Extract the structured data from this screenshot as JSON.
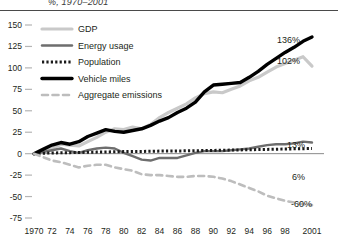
{
  "chart_data": {
    "type": "line",
    "title": "%, 1970–2001",
    "xlabel": "",
    "ylabel": "",
    "ylim": [
      -75,
      150
    ],
    "yticks": [
      150,
      125,
      100,
      75,
      50,
      25,
      0,
      -25,
      -50,
      -75
    ],
    "ytick_labels": [
      "150",
      "125",
      "100",
      "75",
      "50",
      "25",
      "0",
      "-25",
      "-50",
      "-75"
    ],
    "xlim": [
      1970,
      2001
    ],
    "xticks": [
      1970,
      1972,
      1974,
      1976,
      1978,
      1980,
      1982,
      1984,
      1986,
      1988,
      1990,
      1992,
      1994,
      1996,
      1998,
      2001
    ],
    "xtick_labels": [
      "1970",
      "72",
      "74",
      "76",
      "78",
      "80",
      "82",
      "84",
      "86",
      "88",
      "90",
      "92",
      "94",
      "96",
      "98",
      "2001"
    ],
    "grid": false,
    "legend_position": "upper-left",
    "x": [
      1970,
      1971,
      1972,
      1973,
      1974,
      1975,
      1976,
      1977,
      1978,
      1979,
      1980,
      1981,
      1982,
      1983,
      1984,
      1985,
      1986,
      1987,
      1988,
      1989,
      1990,
      1991,
      1992,
      1993,
      1994,
      1995,
      1996,
      1997,
      1998,
      1999,
      2000,
      2001
    ],
    "series": [
      {
        "name": "GDP",
        "color": "#c9c9c9",
        "style": "solid",
        "width": 3.2,
        "end_label": "102%",
        "values": [
          0,
          2,
          6,
          11,
          10,
          9,
          14,
          19,
          25,
          29,
          28,
          31,
          29,
          34,
          42,
          48,
          53,
          58,
          65,
          70,
          72,
          71,
          75,
          79,
          85,
          89,
          95,
          101,
          105,
          109,
          113,
          102
        ]
      },
      {
        "name": "Energy usage",
        "color": "#6e6e6e",
        "style": "solid",
        "width": 2.4,
        "end_label": "13%",
        "values": [
          0,
          2,
          4,
          6,
          3,
          1,
          4,
          6,
          7,
          6,
          1,
          -3,
          -7,
          -8,
          -5,
          -5,
          -5,
          -2,
          1,
          3,
          3,
          3,
          4,
          5,
          6,
          8,
          10,
          11,
          11,
          12,
          14,
          13
        ]
      },
      {
        "name": "Population",
        "color": "#1a1a1a",
        "style": "dotted",
        "width": 3.0,
        "end_label": "6%",
        "values": [
          0,
          0.5,
          0.8,
          1.0,
          1.2,
          1.4,
          1.6,
          1.8,
          2.0,
          2.2,
          2.4,
          2.5,
          2.6,
          2.8,
          3.0,
          3.1,
          3.2,
          3.3,
          3.5,
          3.6,
          3.8,
          4.0,
          4.2,
          4.4,
          4.6,
          4.8,
          5.0,
          5.2,
          5.4,
          5.6,
          5.8,
          6
        ]
      },
      {
        "name": "Vehicle miles",
        "color": "#000000",
        "style": "solid",
        "width": 3.4,
        "end_label": "136%",
        "values": [
          0,
          5,
          10,
          13,
          11,
          14,
          20,
          24,
          28,
          26,
          25,
          27,
          29,
          33,
          38,
          42,
          48,
          53,
          60,
          72,
          80,
          81,
          82,
          83,
          89,
          96,
          104,
          111,
          118,
          124,
          131,
          136
        ]
      },
      {
        "name": "Aggregate emissions",
        "color": "#bdbdbd",
        "style": "dashed",
        "width": 2.6,
        "end_label": "-60%",
        "values": [
          0,
          -4,
          -8,
          -10,
          -13,
          -16,
          -14,
          -13,
          -13,
          -16,
          -18,
          -20,
          -24,
          -25,
          -25,
          -26,
          -27,
          -27,
          -26,
          -26,
          -27,
          -29,
          -32,
          -36,
          -40,
          -44,
          -49,
          -52,
          -55,
          -57,
          -59,
          -60
        ]
      }
    ]
  },
  "legend": {
    "items": [
      {
        "label": "GDP"
      },
      {
        "label": "Energy usage"
      },
      {
        "label": "Population"
      },
      {
        "label": "Vehicle miles"
      },
      {
        "label": "Aggregate emissions"
      }
    ]
  },
  "axis": {
    "zero_line_color": "#8a8a8a",
    "tick_color": "#b5b5b5"
  }
}
